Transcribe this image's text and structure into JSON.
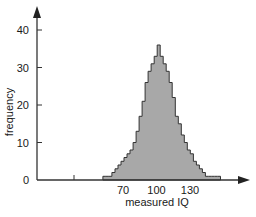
{
  "chart_data": {
    "type": "bar",
    "subtype": "histogram",
    "title": "",
    "xlabel": "measured IQ",
    "ylabel": "frequency",
    "x_ticks": [
      70,
      100,
      130
    ],
    "y_ticks": [
      0,
      10,
      20,
      30,
      40
    ],
    "ylim": [
      0,
      45
    ],
    "xlim": [
      30,
      170
    ],
    "grid": false,
    "legend": null,
    "bin_start": 52,
    "bin_width": 2.7,
    "values": [
      1,
      1,
      1,
      2,
      3,
      4,
      5,
      6,
      7,
      8,
      10,
      13,
      17,
      21,
      26,
      29,
      31,
      33,
      36,
      33,
      31,
      29,
      26,
      22,
      17,
      15,
      12,
      10,
      8,
      7,
      5,
      4,
      3,
      2,
      1,
      1,
      1,
      1,
      1
    ],
    "bar_fill": "#a8a8a8",
    "bar_edge": "#333333",
    "axis_color": "#333333"
  }
}
